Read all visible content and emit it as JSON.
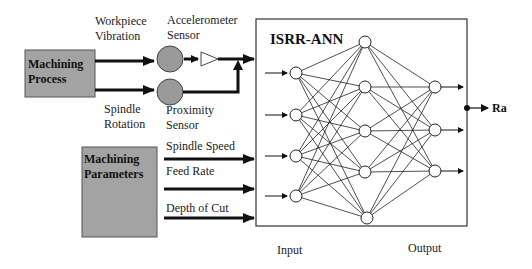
{
  "diagram": {
    "title": "ISRR-ANN",
    "colors": {
      "box_fill": "#a3a3a3",
      "sensor_fill": "#9a9a9a",
      "line": "#111111",
      "background": "#ffffff"
    },
    "blocks": {
      "machining_process": {
        "line1": "Machining",
        "line2": "Process"
      },
      "machining_parameters": {
        "line1": "Machining",
        "line2": "Parameters"
      }
    },
    "signals": {
      "workpiece_vibration": {
        "line1": "Workpiece",
        "line2": "Vibration"
      },
      "spindle_rotation": {
        "line1": "Spindle",
        "line2": "Rotation"
      },
      "accelerometer_sensor": {
        "line1": "Accelerometer",
        "line2": "Sensor"
      },
      "proximity_sensor": {
        "line1": "Proximity",
        "line2": "Sensor"
      }
    },
    "parameters": [
      {
        "label": "Spindle Speed"
      },
      {
        "label": "Feed Rate"
      },
      {
        "label": "Depth of Cut"
      }
    ],
    "network": {
      "input_layer_label": "Input",
      "output_layer_label": "Output",
      "layers": {
        "input_nodes": 4,
        "hidden_nodes": 5,
        "output_nodes": 3
      },
      "output_variable": "Ra"
    }
  }
}
